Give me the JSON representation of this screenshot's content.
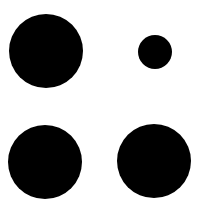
{
  "background": "#ffffff",
  "dots": [
    {
      "name": "dot-top-left",
      "cx": 46,
      "cy": 51,
      "r": 37,
      "color": "#000000"
    },
    {
      "name": "dot-top-right-small",
      "cx": 155,
      "cy": 52,
      "r": 17,
      "color": "#000000"
    },
    {
      "name": "dot-bottom-left",
      "cx": 45,
      "cy": 162,
      "r": 37,
      "color": "#000000"
    },
    {
      "name": "dot-bottom-right",
      "cx": 154,
      "cy": 161,
      "r": 37,
      "color": "#000000"
    }
  ]
}
